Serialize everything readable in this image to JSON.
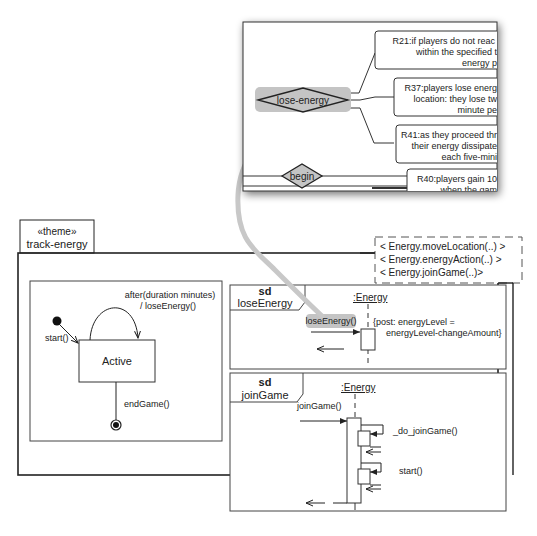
{
  "popup": {
    "decisions": [
      {
        "label": "lose-energy",
        "highlighted": true
      },
      {
        "label": "begin",
        "highlighted": false
      }
    ],
    "rules": [
      {
        "lines": [
          "R21:if players do not reac",
          "within the specified t",
          "energy p"
        ]
      },
      {
        "lines": [
          "R37:players lose energ",
          "location: they lose tw",
          "minute pe"
        ]
      },
      {
        "lines": [
          "R41:as they proceed thr",
          "their energy dissipate",
          "each five-mini"
        ]
      },
      {
        "lines": [
          "R40:players gain 10",
          "when the gam"
        ]
      }
    ]
  },
  "theme": {
    "stereotype": "«theme»",
    "name": "track-energy",
    "template_params": [
      "< Energy.moveLocation(..) >",
      "< Energy.energyAction(..) >",
      "< Energy.joinGame(..)>"
    ]
  },
  "state_machine": {
    "state": "Active",
    "initial_transition": "start()",
    "self_transition": [
      "after(duration minutes)",
      "/ loseEnergy()"
    ],
    "final_transition": "endGame()"
  },
  "sd_lose_energy": {
    "keyword": "sd",
    "name": "loseEnergy",
    "lifeline": ":Energy",
    "message": "loseEnergy()",
    "constraint": [
      "{post: energyLevel =",
      "energyLevel-changeAmount}"
    ]
  },
  "sd_join_game": {
    "keyword": "sd",
    "name": "joinGame",
    "lifeline": ":Energy",
    "message": "joinGame()",
    "self_calls": [
      "_do_joinGame()",
      "start()"
    ]
  },
  "colors": {
    "highlight": "#c4c4c4",
    "connector": "#c8c8c8",
    "line": "#333333"
  }
}
